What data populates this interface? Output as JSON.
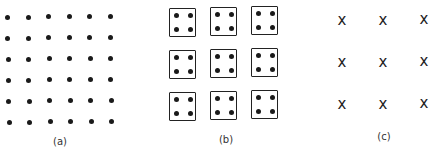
{
  "figure": {
    "panels": [
      {
        "id": "a",
        "label": "(a)",
        "description": "6x6 grid of dots"
      },
      {
        "id": "b",
        "label": "(b)",
        "description": "3x3 grid of squares each containing 4 dots"
      },
      {
        "id": "c",
        "label": "(c)",
        "description": "3x3 grid of x marks"
      }
    ],
    "panel_a": {
      "rows": 6,
      "cols": 6
    },
    "panel_b": {
      "rows": 3,
      "cols": 3,
      "dots_per_box": 4
    },
    "panel_c": {
      "rows": 3,
      "cols": 3,
      "mark": "x"
    }
  }
}
